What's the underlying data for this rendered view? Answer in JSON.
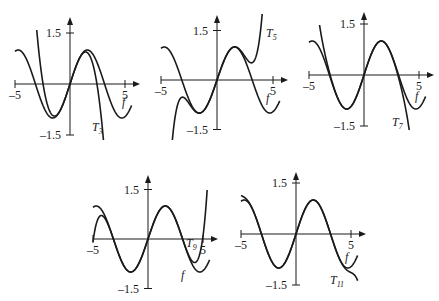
{
  "chart_data": [
    {
      "type": "line",
      "title": "",
      "function": "f(x) = sin(x)",
      "xlim": [
        -5,
        5
      ],
      "ylim": [
        -1.5,
        1.5
      ],
      "x_tick_labels": [
        "-5",
        "5"
      ],
      "y_tick_labels": [
        "1.5",
        "-1.5"
      ],
      "xlabel": "f",
      "series": [
        {
          "name": "f",
          "label": "f",
          "formula": "sin(x)",
          "coefficients": [
            0,
            1,
            0,
            -0.16667,
            0,
            0.0083333,
            0,
            -0.00019841,
            0,
            2.7557e-06,
            0,
            -2.5052e-08,
            0,
            1.6059e-10
          ]
        },
        {
          "name": "T3",
          "label": "T",
          "subscript": "3",
          "formula": "x - x^3/3!",
          "coefficients": [
            0,
            1,
            0,
            -0.16667
          ]
        }
      ]
    },
    {
      "type": "line",
      "title": "",
      "xlim": [
        -5,
        5
      ],
      "ylim": [
        -1.5,
        1.5
      ],
      "x_tick_labels": [
        "-5",
        "5"
      ],
      "y_tick_labels": [
        "1.5",
        "-1.5"
      ],
      "xlabel": "f",
      "series": [
        {
          "name": "f",
          "label": "f",
          "formula": "sin(x)"
        },
        {
          "name": "T5",
          "label": "T",
          "subscript": "5",
          "formula": "x - x^3/3! + x^5/5!",
          "coefficients": [
            0,
            1,
            0,
            -0.16667,
            0,
            0.0083333
          ]
        }
      ]
    },
    {
      "type": "line",
      "title": "",
      "xlim": [
        -5,
        5
      ],
      "ylim": [
        -1.5,
        1.5
      ],
      "x_tick_labels": [
        "-5",
        "5"
      ],
      "y_tick_labels": [
        "1.5",
        "-1.5"
      ],
      "xlabel": "f",
      "series": [
        {
          "name": "f",
          "label": "f",
          "formula": "sin(x)"
        },
        {
          "name": "T7",
          "label": "T",
          "subscript": "7",
          "formula": "x - x^3/3! + x^5/5! - x^7/7!",
          "coefficients": [
            0,
            1,
            0,
            -0.16667,
            0,
            0.0083333,
            0,
            -0.00019841
          ]
        }
      ]
    },
    {
      "type": "line",
      "title": "",
      "xlim": [
        -5,
        5
      ],
      "ylim": [
        -1.5,
        1.5
      ],
      "x_tick_labels": [
        "-5",
        "5"
      ],
      "y_tick_labels": [
        "1.5",
        "-1.5"
      ],
      "xlabel": "f",
      "series": [
        {
          "name": "f",
          "label": "f",
          "formula": "sin(x)"
        },
        {
          "name": "T9",
          "label": "T",
          "subscript": "9",
          "formula": "x - x^3/3! + ... + x^9/9!",
          "coefficients": [
            0,
            1,
            0,
            -0.16667,
            0,
            0.0083333,
            0,
            -0.00019841,
            0,
            2.7557e-06
          ]
        }
      ]
    },
    {
      "type": "line",
      "title": "",
      "xlim": [
        -5,
        5
      ],
      "ylim": [
        -1.5,
        1.5
      ],
      "x_tick_labels": [
        "-5",
        "5"
      ],
      "y_tick_labels": [
        "1.5",
        "-1.5"
      ],
      "xlabel": "f",
      "series": [
        {
          "name": "f",
          "label": "f",
          "formula": "sin(x)"
        },
        {
          "name": "T11",
          "label": "T",
          "subscript": "11",
          "formula": "x - x^3/3! + ... - x^11/11!",
          "coefficients": [
            0,
            1,
            0,
            -0.16667,
            0,
            0.0083333,
            0,
            -0.00019841,
            0,
            2.7557e-06,
            0,
            -2.5052e-08
          ]
        }
      ]
    }
  ]
}
